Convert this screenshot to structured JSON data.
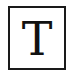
{
  "icon": {
    "letter": "T",
    "semantic": "text-tool-icon",
    "border_color": "#1a1a1a",
    "letter_color": "#111111",
    "background": "#ffffff"
  }
}
